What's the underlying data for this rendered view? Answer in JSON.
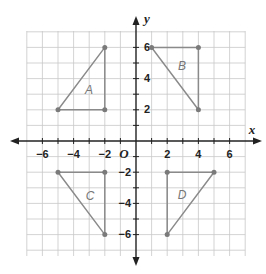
{
  "diagram": {
    "type": "coordinate-plane",
    "x_axis_label": "x",
    "y_axis_label": "y",
    "origin_label": "O",
    "x_ticks": [
      "-6",
      "-4",
      "-2",
      "2",
      "4",
      "6"
    ],
    "y_ticks": [
      "6",
      "4",
      "2",
      "-2",
      "-4",
      "-6"
    ],
    "grid_range": {
      "x": [
        -7,
        7
      ],
      "y": [
        -7,
        7
      ]
    },
    "colors": {
      "triangle_stroke": "#8a8a8a",
      "grid": "#c8c8c8",
      "axis": "#222222"
    },
    "triangles": [
      {
        "label": "A",
        "vertices": [
          [
            -2,
            6
          ],
          [
            -2,
            2
          ],
          [
            -5,
            2
          ]
        ]
      },
      {
        "label": "B",
        "vertices": [
          [
            1,
            6
          ],
          [
            4,
            6
          ],
          [
            4,
            2
          ]
        ]
      },
      {
        "label": "C",
        "vertices": [
          [
            -5,
            -2
          ],
          [
            -2,
            -2
          ],
          [
            -2,
            -6
          ]
        ]
      },
      {
        "label": "D",
        "vertices": [
          [
            2,
            -2
          ],
          [
            5,
            -2
          ],
          [
            2,
            -6
          ]
        ]
      }
    ]
  }
}
